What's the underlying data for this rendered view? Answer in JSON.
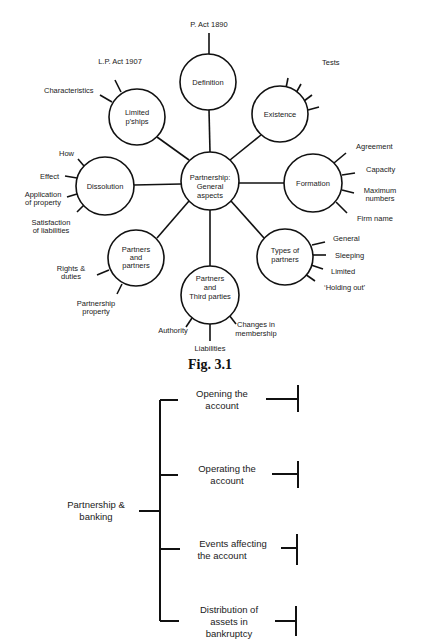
{
  "fig31": {
    "center": {
      "lines": [
        "Partnership:",
        "General",
        "aspects"
      ]
    },
    "nodes": [
      {
        "id": "definition",
        "lines": [
          "Definition"
        ],
        "subtopics": [
          "P. Act 1890"
        ]
      },
      {
        "id": "existence",
        "lines": [
          "Existence"
        ],
        "subtopics": [
          "Tests"
        ]
      },
      {
        "id": "formation",
        "lines": [
          "Formation"
        ],
        "subtopics": [
          "Agreement",
          "Capacity",
          "Maximum numbers",
          "Firm name"
        ]
      },
      {
        "id": "types-of-partners",
        "lines": [
          "Types of",
          "partners"
        ],
        "subtopics": [
          "General",
          "Sleeping",
          "Limited",
          "‘Holding out’"
        ]
      },
      {
        "id": "partners-third-parties",
        "lines": [
          "Partners",
          "and",
          "Third parties"
        ],
        "subtopics": [
          "Authority",
          "Liabilities",
          "Changes in membership"
        ]
      },
      {
        "id": "partners-and-partners",
        "lines": [
          "Partners",
          "and",
          "partners"
        ],
        "subtopics": [
          "Rights & duties",
          "Partnership property"
        ]
      },
      {
        "id": "dissolution",
        "lines": [
          "Dissolution"
        ],
        "subtopics": [
          "How",
          "Effect",
          "Application of property",
          "Satisfaction of liabilities"
        ]
      },
      {
        "id": "limited-pships",
        "lines": [
          "Limited",
          "p’ships"
        ],
        "subtopics": [
          "L.P. Act 1907",
          "Characteristics"
        ]
      }
    ],
    "labels": {
      "p_act": "P. Act 1890",
      "tests": "Tests",
      "lp_act": "L.P. Act 1907",
      "characteristics": "Characteristics",
      "agreement": "Agreement",
      "capacity": "Capacity",
      "maximum": "Maximum",
      "numbers": "numbers",
      "firm_name": "Firm name",
      "general": "General",
      "sleeping": "Sleeping",
      "limited": "Limited",
      "holding_out": "‘Holding out’",
      "authority": "Authority",
      "liabilities": "Liabilities",
      "changes_in": "Changes in",
      "membership": "membership",
      "rights": "Rights &",
      "duties": "duties",
      "partnership": "Partnership",
      "property": "property",
      "how": "How",
      "effect": "Effect",
      "application": "Application",
      "of_property": "of property",
      "satisfaction": "Satisfaction",
      "of_liabilities": "of liabilities"
    },
    "caption": "Fig. 3.1"
  },
  "fig_banking": {
    "root": {
      "lines": [
        "Partnership &",
        "banking"
      ]
    },
    "branches": [
      {
        "lines": [
          "Opening the",
          "account"
        ]
      },
      {
        "lines": [
          "Operating the",
          "account"
        ]
      },
      {
        "lines": [
          "Events affecting",
          "the account"
        ]
      },
      {
        "lines": [
          "Distribution of",
          "assets in",
          "bankruptcy"
        ]
      }
    ]
  }
}
